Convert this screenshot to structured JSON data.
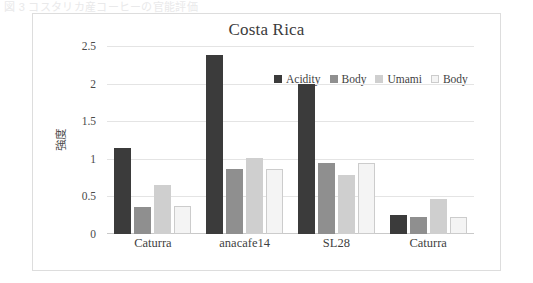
{
  "top_strip": {
    "ghost_text": "図 3  コスタリカ産コーヒーの官能評価"
  },
  "chart_data": {
    "type": "bar",
    "title": "Costa Rica",
    "xlabel": "",
    "ylabel": "強度",
    "categories": [
      "Caturra",
      "anacafe14",
      "SL28",
      "Caturra"
    ],
    "series": [
      {
        "name": "Acidity",
        "color": "#3b3b3b",
        "border": "#3b3b3b",
        "values": [
          1.15,
          2.38,
          2.0,
          0.25
        ]
      },
      {
        "name": "Body",
        "color": "#8f8f8f",
        "border": "#8f8f8f",
        "values": [
          0.36,
          0.86,
          0.94,
          0.22
        ]
      },
      {
        "name": "Umami",
        "color": "#cfcfcf",
        "border": "#cfcfcf",
        "values": [
          0.65,
          1.01,
          0.78,
          0.46
        ]
      },
      {
        "name": "Body",
        "color": "#f4f4f4",
        "border": "#cccccc",
        "values": [
          0.37,
          0.87,
          0.95,
          0.22
        ]
      }
    ],
    "ylim": [
      0,
      2.5
    ],
    "yticks": [
      "0",
      "0.5",
      "1",
      "1.5",
      "2",
      "2.5"
    ],
    "ytick_values": [
      0,
      0.5,
      1,
      1.5,
      2,
      2.5
    ],
    "grid": true,
    "legend_position": "top-center"
  }
}
